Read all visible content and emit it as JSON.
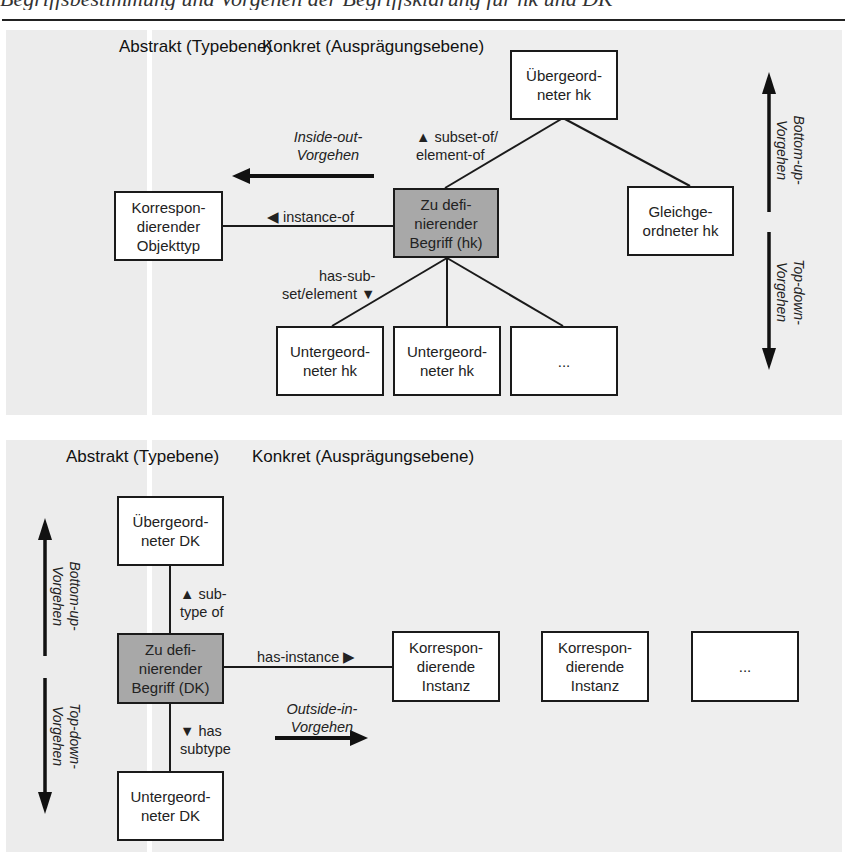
{
  "page": {
    "header_fragment": "Begriffsbestimmung und Vorgehen der Begriffsklärung für hk und DK",
    "colors": {
      "panel_bg": "#eeeeee",
      "focus_box_bg": "#a8a8a8",
      "box_bg": "#ffffff",
      "line": "#1a1a1a"
    }
  },
  "diagram_top": {
    "heading_abstract": "Abstrakt (Typebene)",
    "heading_concrete": "Konkret (Ausprägungsebene)",
    "boxes": {
      "superordinate": "Übergeord-\nneter hk",
      "focus": "Zu defi-\nnierender\nBegriff (hk)",
      "sibling": "Gleichge-\nordneter hk",
      "object_type": "Korrespon-\ndierender\nObjekttyp",
      "sub1": "Untergeord-\nneter hk",
      "sub2": "Untergeord-\nneter hk",
      "sub3": "..."
    },
    "relations": {
      "subset_of": "▲ subset-of/\nelement-of",
      "instance_of": "◀ instance-of",
      "has_subset": "has-sub-\nset/element ▼"
    },
    "approaches": {
      "inside_out": "Inside-out-\nVorgehen",
      "bottom_up": "Bottom-up-\nVorgehen",
      "top_down": "Top-down-\nVorgehen"
    }
  },
  "diagram_bottom": {
    "heading_abstract": "Abstrakt (Typebene)",
    "heading_concrete": "Konkret (Ausprägungsebene)",
    "boxes": {
      "superordinate": "Übergeord-\nneter DK",
      "focus": "Zu defi-\nnierender\nBegriff (DK)",
      "subordinate": "Untergeord-\nneter DK",
      "instance1": "Korrespon-\ndierende\nInstanz",
      "instance2": "Korrespon-\ndierende\nInstanz",
      "instance3": "..."
    },
    "relations": {
      "subtype_of": "▲ sub-\ntype of",
      "has_subtype": "▼ has\nsubtype",
      "has_instance": "has-instance ▶"
    },
    "approaches": {
      "outside_in": "Outside-in-\nVorgehen",
      "bottom_up": "Bottom-up-\nVorgehen",
      "top_down": "Top-down-\nVorgehen"
    }
  }
}
